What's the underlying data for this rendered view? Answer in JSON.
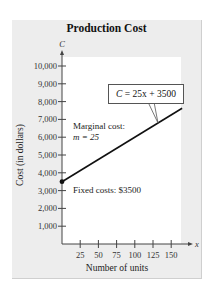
{
  "chart_data": {
    "type": "line",
    "title": "Production Cost",
    "xlabel": "Number of units",
    "ylabel": "Cost (in dollars)",
    "x_axis_symbol": "x",
    "y_axis_symbol": "C",
    "xlim": [
      0,
      165
    ],
    "ylim": [
      0,
      10500
    ],
    "x_ticks": [
      25,
      50,
      75,
      100,
      125,
      150
    ],
    "y_ticks": [
      1000,
      2000,
      3000,
      4000,
      5000,
      6000,
      7000,
      8000,
      9000,
      10000
    ],
    "x_tick_labels": [
      "25",
      "50",
      "75",
      "100",
      "125",
      "150"
    ],
    "y_tick_labels": [
      "1,000",
      "2,000",
      "3,000",
      "4,000",
      "5,000",
      "6,000",
      "7,000",
      "8,000",
      "9,000",
      "10,000"
    ],
    "grid": false,
    "series": [
      {
        "name": "C = 25x + 3500",
        "x": [
          0,
          165
        ],
        "values": [
          3500,
          7625
        ],
        "start_marker": true
      }
    ],
    "annotations": [
      {
        "text": "C = 25x + 3500",
        "boxed": true
      },
      {
        "text": "Marginal cost:",
        "line2": "m = 25"
      },
      {
        "text": "Fixed costs:  $3500"
      }
    ]
  },
  "labels": {
    "title": "Production Cost",
    "xlabel": "Number of units",
    "ylabel": "Cost (in dollars)",
    "x_symbol": "x",
    "y_symbol": "C",
    "equation_lhs": "C",
    "equation_rhs": " = 25x + 3500",
    "marginal_line1": "Marginal cost:",
    "marginal_line2": "m = 25",
    "fixed_costs": "Fixed costs:  $3500"
  },
  "colors": {
    "panel": "#ededed",
    "plot": "#ffffff",
    "line": "#111111"
  }
}
